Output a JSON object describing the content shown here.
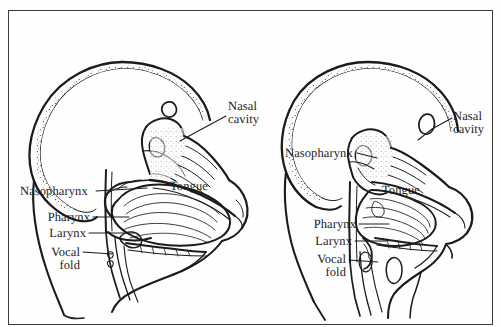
{
  "figure": {
    "caption": "",
    "frame_color": "#3a3a3a",
    "background_color": "#fefefe",
    "ink_color": "#1b1b1b",
    "panel_count": 2
  },
  "panels": [
    {
      "id": "left-panel",
      "name": "infant-vocal-tract",
      "labels": {
        "nasal_cavity": "Nasal\ncavity",
        "nasal_cavity_line1": "Nasal",
        "nasal_cavity_line2": "cavity",
        "nasopharynx": "Nasopharynx",
        "tongue": "Tongue",
        "pharynx": "Pharynx",
        "larynx": "Larynx",
        "vocal_fold_line1": "Vocal",
        "vocal_fold_line2": "fold"
      }
    },
    {
      "id": "right-panel",
      "name": "adult-vocal-tract",
      "labels": {
        "nasal_cavity_line1": "Nasal",
        "nasal_cavity_line2": "cavity",
        "nasopharynx": "Nasopharynx",
        "tongue": "Tongue",
        "pharynx": "Pharynx",
        "larynx": "Larynx",
        "vocal_fold_line1": "Vocal",
        "vocal_fold_line2": "fold"
      }
    }
  ],
  "anatomy_terms": [
    "Nasal cavity",
    "Nasopharynx",
    "Tongue",
    "Pharynx",
    "Larynx",
    "Vocal fold"
  ]
}
